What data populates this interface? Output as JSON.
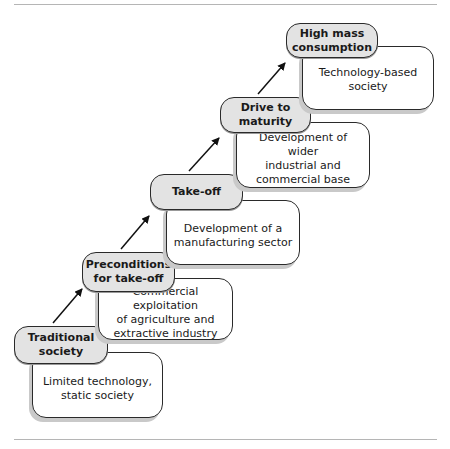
{
  "diagram": {
    "stages": [
      {
        "label": "Traditional\nsociety",
        "description": "Limited technology,\nstatic society"
      },
      {
        "label": "Preconditions\nfor take-off",
        "description": "Commercial exploitation\nof agriculture and\nextractive industry"
      },
      {
        "label": "Take-off",
        "description": "Development of a\nmanufacturing sector"
      },
      {
        "label": "Drive to\nmaturity",
        "description": "Development of wider\nindustrial and\ncommercial base"
      },
      {
        "label": "High mass\nconsumption",
        "description": "Technology-based\nsociety"
      }
    ],
    "colors": {
      "label_fill": "#e3e3e3",
      "border": "#2a2a2a",
      "shadow": "#c9c9c9",
      "rule": "#b5b5b5"
    }
  }
}
